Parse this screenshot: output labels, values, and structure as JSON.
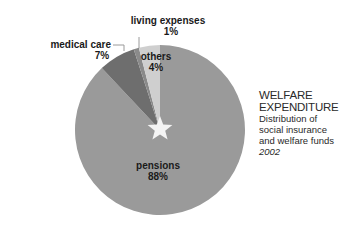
{
  "chart_data": {
    "type": "pie",
    "title": "WELFARE EXPENDITURE",
    "subtitle": "Distribution of social insurance and welfare funds",
    "year": "2002",
    "start_angle_deg": 0,
    "direction": "clockwise",
    "slices": [
      {
        "label": "pensions",
        "value": 88,
        "display": "88%",
        "color": "#9a9a9a"
      },
      {
        "label": "medical care",
        "value": 7,
        "display": "7%",
        "color": "#6e6e6e"
      },
      {
        "label": "living expenses",
        "value": 1,
        "display": "1%",
        "color": "#8a8a8a"
      },
      {
        "label": "others",
        "value": 4,
        "display": "4%",
        "color": "#cfcfcf"
      }
    ],
    "center_marker": "star"
  }
}
